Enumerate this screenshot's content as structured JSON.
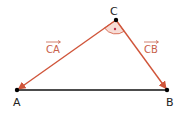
{
  "diagram": {
    "points": {
      "A": {
        "label": "A",
        "x": 17,
        "y": 90
      },
      "B": {
        "label": "B",
        "x": 167,
        "y": 90
      },
      "C": {
        "label": "C",
        "x": 116,
        "y": 20
      }
    },
    "vectors": [
      {
        "label": "CA",
        "from": "C",
        "to": "A"
      },
      {
        "label": "CB",
        "from": "C",
        "to": "B"
      }
    ],
    "segments": [
      {
        "from": "A",
        "to": "B"
      }
    ],
    "angle_marker": {
      "vertex": "C",
      "symbol": "•"
    },
    "colors": {
      "vector": "#d0553a",
      "angle_fill": "#f7dcd6",
      "segment": "#111111",
      "point": "#000000",
      "vector_label": "#c8604a"
    }
  }
}
